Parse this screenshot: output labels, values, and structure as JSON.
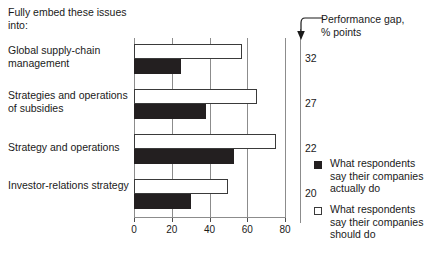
{
  "header": {
    "title": "Fully embed these issues into:"
  },
  "gap_note": {
    "line1": "Performance gap,",
    "line2": "% points",
    "arrow_icon": "down-arrow-icon"
  },
  "legend": {
    "items": [
      {
        "marker": "filled-square-icon",
        "label": "What respondents say their companies actually do"
      },
      {
        "marker": "empty-square-icon",
        "label": "What respondents say their companies should do"
      }
    ]
  },
  "chart_data": {
    "type": "bar",
    "orientation": "horizontal",
    "title": "Fully embed these issues into:",
    "xlabel": "",
    "ylabel": "",
    "xlim": [
      0,
      80
    ],
    "xticks": [
      0,
      20,
      40,
      60,
      80
    ],
    "grid": true,
    "legend_position": "right",
    "categories": [
      "Global supply-chain management",
      "Strategies and operations of subsidies",
      "Strategy and operations",
      "Investor-relations strategy"
    ],
    "series": [
      {
        "name": "What respondents say their companies should do",
        "values": [
          57,
          65,
          75,
          50
        ]
      },
      {
        "name": "What respondents say their companies actually do",
        "values": [
          25,
          38,
          53,
          30
        ]
      }
    ],
    "annotation_column": {
      "label": "Performance gap, % points",
      "values": [
        32,
        27,
        22,
        20
      ]
    }
  }
}
